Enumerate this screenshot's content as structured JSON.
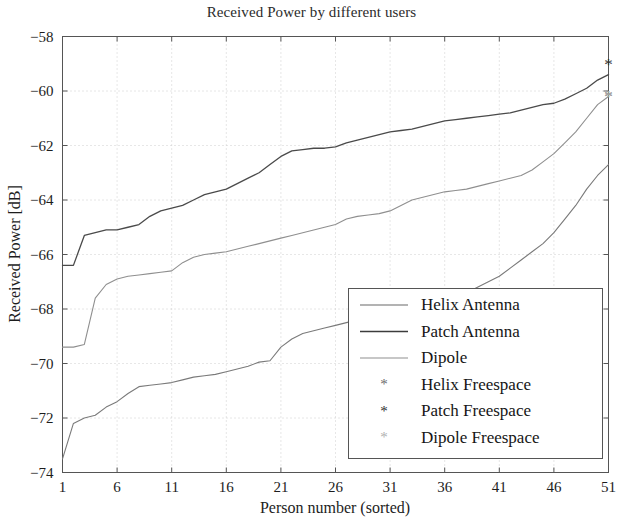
{
  "chart_data": {
    "type": "line",
    "title": "Received Power by different users",
    "xlabel": "Person number (sorted)",
    "ylabel": "Received Power [dB]",
    "xlim": [
      1,
      51
    ],
    "ylim": [
      -74,
      -58
    ],
    "xticks": [
      1,
      6,
      11,
      16,
      21,
      26,
      31,
      36,
      41,
      46,
      51
    ],
    "yticks": [
      -74,
      -72,
      -70,
      -68,
      -66,
      -64,
      -62,
      -60,
      -58
    ],
    "grid": true,
    "legend_position": "lower-right",
    "x": [
      1,
      2,
      3,
      4,
      5,
      6,
      7,
      8,
      9,
      10,
      11,
      12,
      13,
      14,
      15,
      16,
      17,
      18,
      19,
      20,
      21,
      22,
      23,
      24,
      25,
      26,
      27,
      28,
      29,
      30,
      31,
      32,
      33,
      34,
      35,
      36,
      37,
      38,
      39,
      40,
      41,
      42,
      43,
      44,
      45,
      46,
      47,
      48,
      49,
      50,
      51
    ],
    "series": [
      {
        "name": "Patch Antenna",
        "style": "solid-dark",
        "color": "#4a4a4a",
        "values": [
          -66.4,
          -66.4,
          -65.3,
          -65.2,
          -65.1,
          -65.1,
          -65.0,
          -64.9,
          -64.6,
          -64.4,
          -64.3,
          -64.2,
          -64.0,
          -63.8,
          -63.7,
          -63.6,
          -63.4,
          -63.2,
          -63.0,
          -62.7,
          -62.4,
          -62.2,
          -62.15,
          -62.1,
          -62.1,
          -62.05,
          -61.9,
          -61.8,
          -61.7,
          -61.6,
          -61.5,
          -61.45,
          -61.4,
          -61.3,
          -61.2,
          -61.1,
          -61.05,
          -61.0,
          -60.95,
          -60.9,
          -60.85,
          -60.8,
          -60.7,
          -60.6,
          -60.5,
          -60.45,
          -60.3,
          -60.1,
          -59.9,
          -59.6,
          -59.4
        ]
      },
      {
        "name": "Helix Antenna",
        "style": "solid-light",
        "color": "#8f8f8f",
        "values": [
          -69.4,
          -69.4,
          -69.3,
          -67.6,
          -67.1,
          -66.9,
          -66.8,
          -66.75,
          -66.7,
          -66.65,
          -66.6,
          -66.3,
          -66.1,
          -66.0,
          -65.95,
          -65.9,
          -65.8,
          -65.7,
          -65.6,
          -65.5,
          -65.4,
          -65.3,
          -65.2,
          -65.1,
          -65.0,
          -64.9,
          -64.7,
          -64.6,
          -64.55,
          -64.5,
          -64.4,
          -64.2,
          -64.0,
          -63.9,
          -63.8,
          -63.7,
          -63.65,
          -63.6,
          -63.5,
          -63.4,
          -63.3,
          -63.2,
          -63.1,
          -62.9,
          -62.6,
          -62.3,
          -61.9,
          -61.5,
          -61.0,
          -60.5,
          -60.2
        ]
      },
      {
        "name": "Dipole",
        "style": "solid-mid",
        "color": "#7a7a7a",
        "values": [
          -73.5,
          -72.2,
          -72.0,
          -71.9,
          -71.6,
          -71.4,
          -71.1,
          -70.85,
          -70.8,
          -70.75,
          -70.7,
          -70.6,
          -70.5,
          -70.45,
          -70.4,
          -70.3,
          -70.2,
          -70.1,
          -69.95,
          -69.9,
          -69.4,
          -69.1,
          -68.9,
          -68.8,
          -68.7,
          -68.6,
          -68.5,
          -68.4,
          -68.35,
          -68.3,
          -68.2,
          -68.1,
          -68.0,
          -67.95,
          -67.9,
          -67.8,
          -67.6,
          -67.4,
          -67.2,
          -67.0,
          -66.8,
          -66.5,
          -66.2,
          -65.9,
          -65.6,
          -65.2,
          -64.7,
          -64.2,
          -63.6,
          -63.1,
          -62.7
        ]
      }
    ],
    "markers": [
      {
        "name": "Helix Freespace",
        "symbol": "*",
        "color": "#6b6b6b",
        "x": 51,
        "y": -60.2
      },
      {
        "name": "Patch Freespace",
        "symbol": "*",
        "color": "#2e2e2e",
        "x": 51,
        "y": -59.0
      },
      {
        "name": "Dipole Freespace",
        "symbol": "*",
        "color": "#a9a9a9",
        "x": 51,
        "y": -60.2
      }
    ],
    "legend": [
      {
        "label": "Helix Antenna",
        "kind": "line",
        "color": "#9a9a9a"
      },
      {
        "label": "Patch Antenna",
        "kind": "line",
        "color": "#3c3c3c"
      },
      {
        "label": "Dipole",
        "kind": "line",
        "color": "#b4b4b4"
      },
      {
        "label": "Helix Freespace",
        "kind": "marker",
        "color": "#6b6b6b"
      },
      {
        "label": "Patch Freespace",
        "kind": "marker",
        "color": "#2e2e2e"
      },
      {
        "label": "Dipole Freespace",
        "kind": "marker",
        "color": "#b0b0b0"
      }
    ]
  }
}
